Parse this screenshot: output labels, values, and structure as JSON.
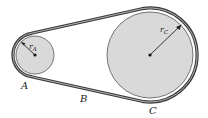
{
  "figure": {
    "type": "belt-drive pulley diagram",
    "labels": {
      "point_a": "A",
      "point_b": "B",
      "point_c": "C",
      "radius_a": "r",
      "radius_a_sub": "A",
      "radius_c": "r",
      "radius_c_sub": "C"
    },
    "pulleys": [
      {
        "name": "A",
        "cx": 35,
        "cy": 55,
        "r": 19
      },
      {
        "name": "C",
        "cx": 150,
        "cy": 55,
        "r": 43
      }
    ],
    "colors": {
      "pulley_fill": "#d9d9d9",
      "belt": "#3a3a3a",
      "belt_inner": "#bfbfbf",
      "line": "#222222"
    }
  }
}
